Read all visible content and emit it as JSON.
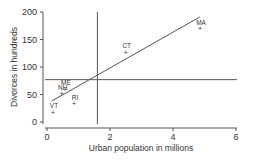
{
  "chart_data": {
    "type": "scatter",
    "title": "",
    "xlabel": "Urban population in millions",
    "ylabel": "Divorces in hundreds",
    "xlim": [
      0,
      6
    ],
    "ylim": [
      0,
      200
    ],
    "x_ticks": [
      0,
      2,
      4,
      6
    ],
    "y_ticks": [
      0,
      50,
      100,
      150,
      200
    ],
    "grid": false,
    "legend": "none",
    "points": [
      {
        "label": "VT",
        "x": 0.19,
        "y": 18
      },
      {
        "label": "NH",
        "x": 0.47,
        "y": 51
      },
      {
        "label": "ME",
        "x": 0.57,
        "y": 60
      },
      {
        "label": "RI",
        "x": 0.86,
        "y": 33
      },
      {
        "label": "CT",
        "x": 2.5,
        "y": 127
      },
      {
        "label": "MA",
        "x": 4.86,
        "y": 170
      }
    ],
    "regression_line": {
      "x": [
        0.15,
        4.85
      ],
      "y": [
        38,
        191
      ]
    },
    "mean_lines": {
      "x_mean": 1.6,
      "y_mean": 77
    }
  },
  "labels": {
    "xlabel": "Urban population in millions",
    "ylabel": "Divorces in hundreds",
    "x_ticks": [
      "0",
      "2",
      "4",
      "6"
    ],
    "y_ticks": [
      "0",
      "50",
      "100",
      "150",
      "200"
    ],
    "points": [
      "VT",
      "NH",
      "ME",
      "RI",
      "CT",
      "MA"
    ]
  }
}
